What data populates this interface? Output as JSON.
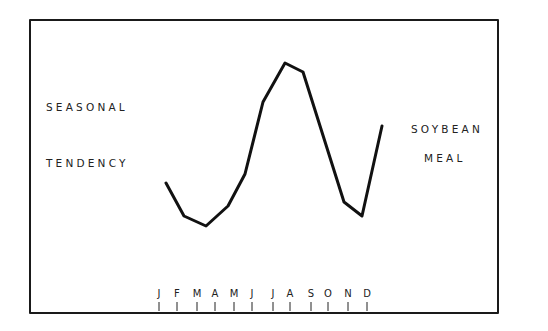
{
  "chart_data": {
    "type": "line",
    "left_label": [
      "SEASONAL",
      "TENDENCY"
    ],
    "right_label": [
      "SOYBEAN",
      "MEAL"
    ],
    "xlabel": "",
    "ylabel": "",
    "categories": [
      "J",
      "F",
      "M",
      "A",
      "M",
      "J",
      "J",
      "A",
      "S",
      "O",
      "N",
      "D"
    ],
    "y_axis_shown": false,
    "grid": false,
    "legend": "none",
    "series": [
      {
        "name": "Soybean Meal seasonal tendency (relative index, 0=low, 100=high)",
        "color": "#111111",
        "points_px": [
          [
            166,
            183
          ],
          [
            184,
            216
          ],
          [
            206,
            226
          ],
          [
            228,
            206
          ],
          [
            245,
            174
          ],
          [
            263,
            102
          ],
          [
            285,
            63
          ],
          [
            303,
            72
          ],
          [
            344,
            202
          ],
          [
            362,
            216
          ],
          [
            382,
            126
          ]
        ],
        "values_relative": [
          26,
          6,
          0,
          12,
          32,
          76,
          100,
          94,
          15,
          6,
          61
        ]
      }
    ],
    "tick_x_px": [
      159,
      177,
      197,
      215,
      234,
      252,
      273,
      290,
      311,
      328,
      348,
      367
    ]
  },
  "labels": {
    "left_line1": "SEASONAL",
    "left_line2": "TENDENCY",
    "right_line1": "SOYBEAN",
    "right_line2": "MEAL"
  },
  "months": [
    "J",
    "F",
    "M",
    "A",
    "M",
    "J",
    "J",
    "A",
    "S",
    "O",
    "N",
    "D"
  ]
}
